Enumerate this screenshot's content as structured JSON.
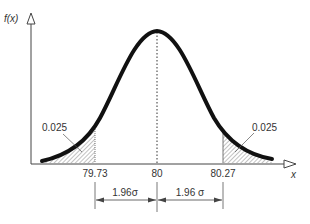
{
  "diagram": {
    "y_axis_label": "f(x)",
    "x_axis_label": "x",
    "mean_label": "80",
    "left_cutoff_label": "79.73",
    "right_cutoff_label": "80.27",
    "left_tail_area": "0.025",
    "right_tail_area": "0.025",
    "left_interval_label": "1.96σ",
    "right_interval_label": "1.96 σ",
    "colors": {
      "curve": "#111111",
      "axis": "#444444",
      "hatch": "#666666"
    }
  }
}
